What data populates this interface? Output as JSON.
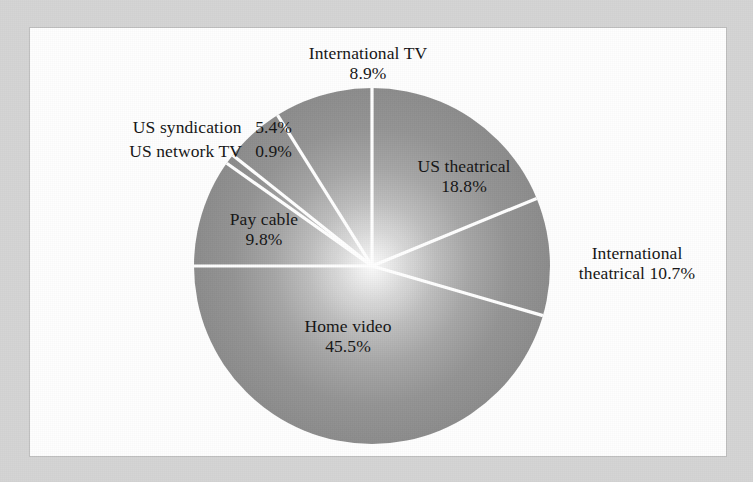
{
  "figure": {
    "background_color": "#d4d4d4",
    "canvas_color": "#fefefe",
    "divider_color": "#ffffff"
  },
  "chart_data": {
    "type": "pie",
    "title": "",
    "subtitle": "",
    "xlabel": "",
    "ylabel": "",
    "legend_position": "none",
    "grid": false,
    "start_angle_deg": 0,
    "direction": "clockwise",
    "units": "percent",
    "categories": [
      "US theatrical",
      "International theatrical",
      "Home video",
      "Pay cable",
      "US network TV",
      "US syndication",
      "International TV"
    ],
    "values": [
      18.8,
      10.7,
      45.5,
      9.8,
      0.9,
      5.4,
      8.9
    ],
    "total": 100.0,
    "slice_fill": "#8e8e8e",
    "slice_center_fill": "#f7f7f7",
    "slices": [
      {
        "name": "US theatrical",
        "value": 18.8,
        "value_text": "18.8%",
        "label_placement": "inside",
        "label_lines": [
          "US theatrical",
          "18.8%"
        ]
      },
      {
        "name": "International theatrical",
        "value": 10.7,
        "value_text": "10.7%",
        "label_placement": "outside",
        "label_lines": [
          "International",
          "theatrical 10.7%"
        ]
      },
      {
        "name": "Home video",
        "value": 45.5,
        "value_text": "45.5%",
        "label_placement": "inside",
        "label_lines": [
          "Home video",
          "45.5%"
        ]
      },
      {
        "name": "Pay cable",
        "value": 9.8,
        "value_text": "9.8%",
        "label_placement": "inside",
        "label_lines": [
          "Pay cable",
          "9.8%"
        ]
      },
      {
        "name": "US network TV",
        "value": 0.9,
        "value_text": "0.9%",
        "label_placement": "outside",
        "label_lines": [
          "US network TV 0.9%"
        ]
      },
      {
        "name": "US syndication",
        "value": 5.4,
        "value_text": "5.4%",
        "label_placement": "outside",
        "label_lines": [
          "US syndication 5.4%"
        ]
      },
      {
        "name": "International TV",
        "value": 8.9,
        "value_text": "8.9%",
        "label_placement": "outside",
        "label_lines": [
          "International TV",
          "8.9%"
        ]
      }
    ]
  },
  "labels": {
    "international_tv": {
      "name": "International TV",
      "value": "8.9%"
    },
    "us_syndication": {
      "name": "US syndication",
      "value": "5.4%"
    },
    "us_network_tv": {
      "name": "US network TV",
      "value": "0.9%"
    },
    "pay_cable": {
      "name": "Pay cable",
      "value": "9.8%"
    },
    "us_theatrical": {
      "name": "US theatrical",
      "value": "18.8%"
    },
    "international_theatrical": {
      "name": "International",
      "value": "theatrical 10.7%"
    },
    "home_video": {
      "name": "Home video",
      "value": "45.5%"
    }
  }
}
